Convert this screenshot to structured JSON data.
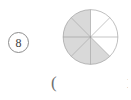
{
  "worksheet": {
    "item_number": "8",
    "answer_open_paren": "(",
    "edge_clipped_mark": "1"
  },
  "colors": {
    "shaded_fill": "#d9d9d9",
    "unshaded_fill": "#ffffff",
    "outline": "#8d8d8d",
    "divider": "#8d8d8d",
    "text": "#3d3d3d"
  },
  "chart_data": {
    "type": "pie",
    "title": "",
    "xlabel": "",
    "ylabel": "",
    "total_sectors": 8,
    "shaded_sectors": 5,
    "unshaded_sectors": 3,
    "fraction_shaded": "5/8",
    "sector_angle_degrees": 45,
    "grid": false,
    "legend": "none",
    "categories": [
      "sector-1",
      "sector-2",
      "sector-3",
      "sector-4",
      "sector-5",
      "sector-6",
      "sector-7",
      "sector-8"
    ],
    "values": [
      12.5,
      12.5,
      12.5,
      12.5,
      12.5,
      12.5,
      12.5,
      12.5
    ],
    "series": [
      {
        "name": "shading",
        "values": [
          "unshaded",
          "unshaded",
          "unshaded",
          "shaded",
          "shaded",
          "shaded",
          "shaded",
          "shaded"
        ]
      }
    ],
    "sectors": [
      {
        "index": 1,
        "start_deg": -90,
        "end_deg": -45,
        "state": "unshaded"
      },
      {
        "index": 2,
        "start_deg": -45,
        "end_deg": 0,
        "state": "unshaded"
      },
      {
        "index": 3,
        "start_deg": 0,
        "end_deg": 45,
        "state": "unshaded"
      },
      {
        "index": 4,
        "start_deg": 45,
        "end_deg": 90,
        "state": "shaded"
      },
      {
        "index": 5,
        "start_deg": 90,
        "end_deg": 135,
        "state": "shaded"
      },
      {
        "index": 6,
        "start_deg": 135,
        "end_deg": 180,
        "state": "shaded"
      },
      {
        "index": 7,
        "start_deg": 180,
        "end_deg": 225,
        "state": "shaded"
      },
      {
        "index": 8,
        "start_deg": 225,
        "end_deg": 270,
        "state": "shaded"
      }
    ]
  }
}
